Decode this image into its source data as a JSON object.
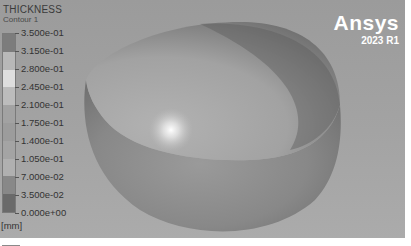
{
  "legend": {
    "title": "THICKNESS",
    "subtitle": "Contour 1",
    "unit": "[mm]",
    "ticks": [
      "3.500e-01",
      "3.150e-01",
      "2.800e-01",
      "2.450e-01",
      "2.100e-01",
      "1.750e-01",
      "1.400e-01",
      "1.050e-01",
      "7.000e-02",
      "3.500e-02",
      "0.000e+00"
    ],
    "band_colors": [
      "#7c7c7c",
      "#b8b8b8",
      "#dedede",
      "#bcbcbc",
      "#a2a2a2",
      "#9c9c9c",
      "#a4a4a4",
      "#b0b0b0",
      "#888888",
      "#6a6a6a"
    ]
  },
  "brand": {
    "name": "Ansys",
    "version": "2023 R1"
  },
  "model": {
    "description": "hemispherical shell",
    "outer_color": "#8d8d8d",
    "inner_color": "#a9a9a9",
    "shadow_color": "#6a6a6a",
    "highlight_color": "#ffffff"
  }
}
